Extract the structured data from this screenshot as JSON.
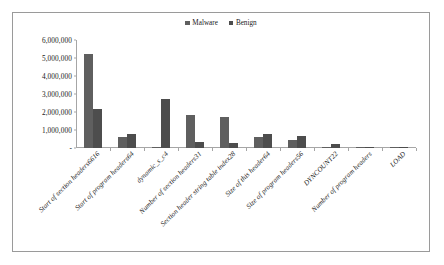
{
  "chart_data": {
    "type": "bar",
    "title": "",
    "xlabel": "",
    "ylabel": "",
    "ylim": [
      0,
      6000000
    ],
    "grid": false,
    "legend_position": "top-center",
    "y_ticks": [
      "-",
      "1,000,000",
      "2,000,000",
      "3,000,000",
      "4,000,000",
      "5,000,000",
      "6,000,000"
    ],
    "y_tick_values": [
      0,
      1000000,
      2000000,
      3000000,
      4000000,
      5000000,
      6000000
    ],
    "categories": [
      "Start of section headers6616",
      "Start of program headers64",
      "dynamic_s_c4",
      "Number of section headers31",
      "Section header string table index28",
      "Size of this header64",
      "Size of program headers56",
      "DYNCOUNT22",
      "Number of program headers",
      "LOAD"
    ],
    "series": [
      {
        "name": "Malware",
        "color": "#5f5f5f",
        "values": [
          5200000,
          600000,
          30000,
          1820000,
          1730000,
          600000,
          450000,
          20000,
          10000,
          4000
        ]
      },
      {
        "name": "Benign",
        "color": "#4d4d4d",
        "values": [
          2150000,
          780000,
          2750000,
          330000,
          300000,
          760000,
          660000,
          220000,
          60000,
          4000
        ]
      }
    ]
  },
  "legend": {
    "entries": [
      {
        "label": "Malware",
        "marker": "square-marker"
      },
      {
        "label": "Benign",
        "marker": "square-marker"
      }
    ]
  }
}
